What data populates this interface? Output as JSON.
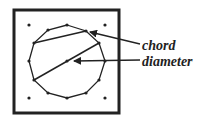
{
  "diagram": {
    "colors": {
      "stroke": "#222222",
      "background": "#ffffff"
    },
    "frame": {
      "x": 14,
      "y": 10,
      "width": 105,
      "height": 103
    },
    "corner_pegs": [
      [
        29,
        25
      ],
      [
        105,
        25
      ],
      [
        29,
        98
      ],
      [
        105,
        98
      ]
    ],
    "center_peg": [
      67,
      61
    ],
    "polygon_points": [
      [
        67,
        25
      ],
      [
        86,
        31
      ],
      [
        99,
        43
      ],
      [
        105,
        61
      ],
      [
        99,
        80
      ],
      [
        86,
        93
      ],
      [
        67,
        98
      ],
      [
        48,
        93
      ],
      [
        34,
        80
      ],
      [
        29,
        61
      ],
      [
        34,
        43
      ],
      [
        48,
        30
      ]
    ],
    "chord": {
      "from": [
        34,
        43
      ],
      "to": [
        86,
        31
      ]
    },
    "diameter": {
      "from": [
        34,
        80
      ],
      "to": [
        99,
        43
      ]
    },
    "labels": {
      "chord": "chord",
      "diameter": "diameter"
    },
    "arrows": [
      {
        "name": "chord-arrow",
        "from": [
          140,
          44
        ],
        "to": [
          90,
          32
        ]
      },
      {
        "name": "diameter-arrow",
        "from": [
          140,
          60
        ],
        "to": [
          74,
          61
        ]
      }
    ]
  }
}
